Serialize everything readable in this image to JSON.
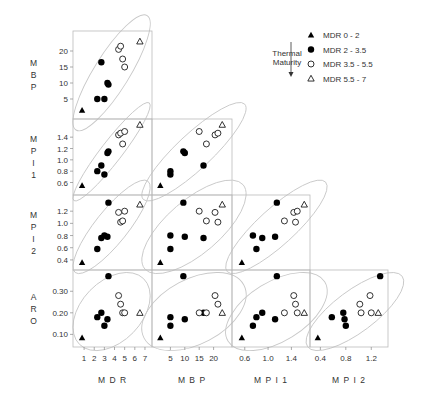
{
  "chart_data": {
    "type": "scatter",
    "title": "",
    "layout": "lower-triangle scatterplot matrix with 95% confidence ellipses",
    "variables": [
      "MDR",
      "MBP",
      "MPI 1",
      "MPI 2",
      "ARO"
    ],
    "row_labels": [
      "MBP",
      "MPI1",
      "MPI2",
      "ARO"
    ],
    "col_labels": [
      "M D R",
      "M B P",
      "M P I 1",
      "M P I 2"
    ],
    "axes": {
      "MDR": {
        "ticks": [
          1,
          2,
          3,
          4,
          5,
          6,
          7
        ],
        "range": [
          0.3,
          7.3
        ]
      },
      "MBP": {
        "ticks": [
          5,
          10,
          15,
          20
        ],
        "range": [
          0,
          25
        ]
      },
      "MPI1": {
        "ticks": [
          0.6,
          0.8,
          1.0,
          1.2,
          1.4
        ],
        "x_ticks": [
          0.6,
          1.0,
          1.4
        ],
        "range": [
          0.45,
          1.65
        ]
      },
      "MPI2": {
        "ticks": [
          0.4,
          0.6,
          0.8,
          1.0,
          1.2
        ],
        "x_ticks": [
          0.4,
          0.8,
          1.2
        ],
        "range": [
          0.3,
          1.4
        ]
      },
      "ARO": {
        "ticks": [
          0.1,
          0.2,
          0.3
        ],
        "range": [
          0.06,
          0.38
        ]
      }
    },
    "legend": {
      "title": "Thermal Maturity",
      "arrow": "down",
      "entries": [
        {
          "label": "MDR 0 - 2",
          "marker": "filled-triangle"
        },
        {
          "label": "MDR 2 - 3.5",
          "marker": "filled-circle"
        },
        {
          "label": "MDR 3.5 - 5.5",
          "marker": "open-circle"
        },
        {
          "label": "MDR 5.5 - 7",
          "marker": "open-triangle"
        }
      ]
    },
    "samples": [
      {
        "group": 0,
        "MDR": 0.8,
        "MBP": 1.5,
        "MPI1": 0.55,
        "MPI2": 0.36,
        "ARO": 0.085
      },
      {
        "group": 1,
        "MDR": 2.3,
        "MBP": 5.0,
        "MPI1": 0.8,
        "MPI2": 0.58,
        "ARO": 0.18
      },
      {
        "group": 1,
        "MDR": 2.7,
        "MBP": 16.5,
        "MPI1": 0.9,
        "MPI2": 0.76,
        "ARO": 0.2
      },
      {
        "group": 1,
        "MDR": 3.0,
        "MBP": 5.0,
        "MPI1": 0.74,
        "MPI2": 0.8,
        "ARO": 0.14
      },
      {
        "group": 1,
        "MDR": 3.3,
        "MBP": 10.0,
        "MPI1": 1.12,
        "MPI2": 0.78,
        "ARO": 0.17
      },
      {
        "group": 1,
        "MDR": 3.4,
        "MBP": 9.5,
        "MPI1": 1.15,
        "MPI2": 1.34,
        "ARO": 0.37
      },
      {
        "group": 2,
        "MDR": 4.4,
        "MBP": 20.5,
        "MPI1": 1.44,
        "MPI2": 1.18,
        "ARO": 0.28
      },
      {
        "group": 2,
        "MDR": 4.6,
        "MBP": 21.5,
        "MPI1": 1.47,
        "MPI2": 1.02,
        "ARO": 0.24
      },
      {
        "group": 2,
        "MDR": 4.8,
        "MBP": 17.5,
        "MPI1": 1.28,
        "MPI2": 1.04,
        "ARO": 0.2
      },
      {
        "group": 2,
        "MDR": 5.0,
        "MBP": 15.0,
        "MPI1": 1.5,
        "MPI2": 1.2,
        "ARO": 0.2
      },
      {
        "group": 3,
        "MDR": 6.5,
        "MBP": 23.0,
        "MPI1": 1.62,
        "MPI2": 1.31,
        "ARO": 0.2
      }
    ],
    "ellipses": "95% confidence ellipse drawn in each panel (light gray)",
    "grid": false
  },
  "legend_title_line1": "Thermal",
  "legend_title_line2": "Maturity"
}
